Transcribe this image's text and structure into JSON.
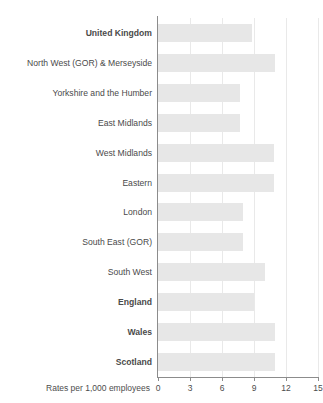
{
  "chart_data": {
    "type": "bar",
    "orientation": "horizontal",
    "title": "",
    "subtitle": "",
    "xlabel": "Rates per 1,000 employees",
    "ylabel": "",
    "xlim": [
      0,
      15
    ],
    "xticks": [
      0,
      3,
      6,
      9,
      12,
      15
    ],
    "xtick_labels": [
      "0",
      "3",
      "6",
      "9",
      "12",
      "15"
    ],
    "grid": true,
    "grid_axis": "x",
    "legend": false,
    "bar_color": "#e7e7e7",
    "axis_color": "#8c8c8c",
    "gridline_color": "#e9e9e9",
    "label_color": "#4a4a4a",
    "categories": [
      "United Kingdom",
      "North West (GOR) & Merseyside",
      "Yorkshire and the Humber",
      "East Midlands",
      "West Midlands",
      "Eastern",
      "London",
      "South East (GOR)",
      "South West",
      "England",
      "Wales",
      "Scotland"
    ],
    "values": [
      8.8,
      11.0,
      7.7,
      7.7,
      10.9,
      10.9,
      8.0,
      8.0,
      10.0,
      9.0,
      11.0,
      11.0
    ],
    "emphasis": [
      true,
      false,
      false,
      false,
      false,
      false,
      false,
      false,
      false,
      true,
      true,
      true
    ]
  }
}
